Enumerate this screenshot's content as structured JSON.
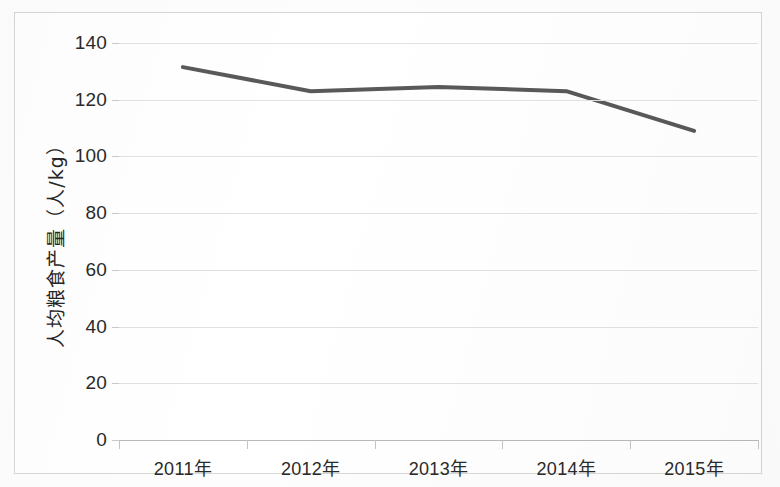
{
  "chart_data": {
    "type": "line",
    "title": "",
    "subtitle": "",
    "xlabel": "",
    "ylabel": "人均粮食产量（人/kg）",
    "categories": [
      "2011年",
      "2012年",
      "2013年",
      "2014年",
      "2015年"
    ],
    "values": [
      131.5,
      123.0,
      124.5,
      123.0,
      109.0
    ],
    "series": [
      {
        "name": "人均粮食产量",
        "values": [
          131.5,
          123.0,
          124.5,
          123.0,
          109.0
        ]
      }
    ],
    "ylim": [
      0,
      140
    ],
    "ytick_step": 20,
    "ytick_labels": [
      "0",
      "20",
      "40",
      "60",
      "80",
      "100",
      "120",
      "140"
    ],
    "ytick_values": [
      0,
      20,
      40,
      60,
      80,
      100,
      120,
      140
    ],
    "grid": true,
    "legend": false,
    "legend_position": "none",
    "line_color": "#595959",
    "line_width": 4,
    "markers": false,
    "plot_background": "#ffffff",
    "gridline_color": "#e2e2e2",
    "axis_color": "#b9b9b9",
    "border_color": "#d6d6d6",
    "text_color": "#2a2a2a"
  }
}
